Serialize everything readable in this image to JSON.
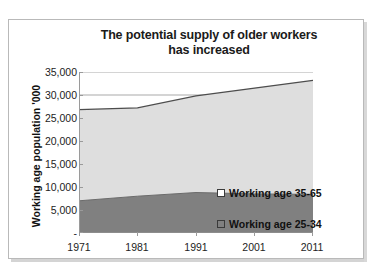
{
  "chart_data": {
    "type": "area",
    "stacked": true,
    "title": "The potential supply of older workers has increased",
    "title_lines": [
      "The potential supply of older workers",
      "has increased"
    ],
    "xlabel": "",
    "ylabel": "Working age population '000",
    "categories": [
      "1971",
      "1981",
      "1991",
      "2001",
      "2011"
    ],
    "x": [
      1971,
      1981,
      1991,
      2001,
      2011
    ],
    "series": [
      {
        "name": "Working age  25-34",
        "color": "#808080",
        "values": [
          7000,
          8000,
          8800,
          8500,
          8400
        ]
      },
      {
        "name": "Working age  35-65",
        "color": "#dedede",
        "values": [
          19800,
          19200,
          21000,
          23000,
          24800
        ]
      }
    ],
    "stacked_totals": [
      26800,
      27200,
      29800,
      31500,
      33200
    ],
    "ylim": [
      0,
      35000
    ],
    "ytick_values": [
      0,
      5000,
      10000,
      15000,
      20000,
      25000,
      30000,
      35000
    ],
    "ytick_labels": [
      "-",
      "5,000",
      "10,000",
      "15,000",
      "20,000",
      "25,000",
      "30,000",
      "35,000"
    ],
    "grid": true,
    "gridlines_at": [
      30000,
      35000
    ],
    "legend_position": "inside-center",
    "legend": [
      {
        "label": "Working age  35-65",
        "swatch": "#ffffff"
      },
      {
        "label": "Working age  25-34",
        "swatch": "#808080"
      }
    ]
  },
  "colors": {
    "series_older": "#dedede",
    "series_younger": "#808080",
    "line": "#4d4d4d",
    "axis": "#9a9a9a",
    "text": "#1a1a1a",
    "frame": "#b9b9b9",
    "background": "#ffffff"
  }
}
